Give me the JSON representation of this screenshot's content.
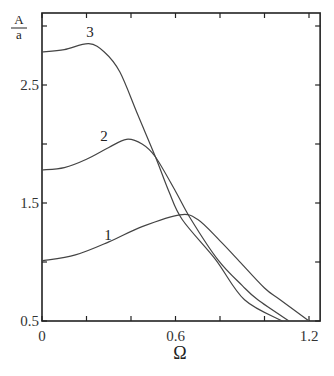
{
  "chart_data": {
    "type": "line",
    "title": "",
    "xlabel": "Ω",
    "ylabel": "A/a",
    "ylabel_num": "A",
    "ylabel_den": "a",
    "xlim": [
      0,
      1.25
    ],
    "ylim": [
      0.5,
      3.0
    ],
    "grid": false,
    "legend": "inline curve labels",
    "x_ticks": [
      0,
      0.2,
      0.4,
      0.6,
      0.8,
      1.0,
      1.2
    ],
    "x_tick_labels": [
      {
        "value": 0,
        "label": "0"
      },
      {
        "value": 0.6,
        "label": "0.6"
      },
      {
        "value": 1.2,
        "label": "1.2"
      }
    ],
    "y_ticks": [
      0.5,
      1.0,
      1.5,
      2.0,
      2.5,
      3.0
    ],
    "y_tick_labels": [
      {
        "value": 0.5,
        "label": "0.5"
      },
      {
        "value": 1.5,
        "label": "1.5"
      },
      {
        "value": 2.5,
        "label": "2.5"
      }
    ],
    "series": [
      {
        "name": "1",
        "label": "1",
        "x": [
          0,
          0.15,
          0.3,
          0.45,
          0.62,
          0.7,
          0.8,
          0.88,
          1.0,
          1.07,
          1.2
        ],
        "y": [
          1.01,
          1.06,
          1.17,
          1.3,
          1.4,
          1.36,
          1.18,
          1.02,
          0.78,
          0.68,
          0.5
        ]
      },
      {
        "name": "2",
        "label": "2",
        "x": [
          0,
          0.1,
          0.2,
          0.3,
          0.38,
          0.45,
          0.51,
          0.6,
          0.67,
          0.79,
          0.9,
          0.97,
          1.11
        ],
        "y": [
          1.78,
          1.8,
          1.87,
          1.97,
          2.04,
          2.0,
          1.89,
          1.6,
          1.36,
          1.02,
          0.8,
          0.68,
          0.5
        ]
      },
      {
        "name": "3",
        "label": "3",
        "x": [
          0,
          0.1,
          0.21,
          0.28,
          0.35,
          0.43,
          0.51,
          0.57,
          0.63,
          0.78,
          0.91,
          1.08
        ],
        "y": [
          2.78,
          2.8,
          2.85,
          2.78,
          2.61,
          2.25,
          1.89,
          1.6,
          1.36,
          1.02,
          0.68,
          0.5
        ]
      }
    ]
  }
}
